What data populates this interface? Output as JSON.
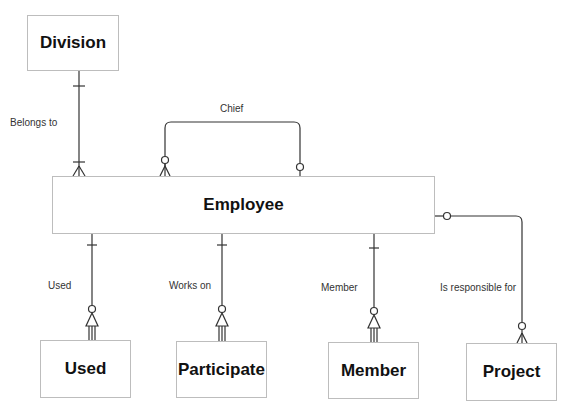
{
  "diagram": {
    "type": "entity-relationship",
    "entities": [
      {
        "id": "division",
        "label": "Division"
      },
      {
        "id": "employee",
        "label": "Employee"
      },
      {
        "id": "used",
        "label": "Used"
      },
      {
        "id": "participate",
        "label": "Participate"
      },
      {
        "id": "member",
        "label": "Member"
      },
      {
        "id": "project",
        "label": "Project"
      }
    ],
    "relationships": [
      {
        "from": "division",
        "to": "employee",
        "label": "Belongs to",
        "from_card": "one",
        "to_card": "one-or-many"
      },
      {
        "from": "employee",
        "to": "employee",
        "label": "Chief",
        "from_card": "zero-or-many",
        "to_card": "zero-or-one"
      },
      {
        "from": "employee",
        "to": "used",
        "label": "Used",
        "from_card": "one",
        "to_card": "zero-or-many"
      },
      {
        "from": "employee",
        "to": "participate",
        "label": "Works on",
        "from_card": "one",
        "to_card": "zero-or-many"
      },
      {
        "from": "employee",
        "to": "member",
        "label": "Member",
        "from_card": "one",
        "to_card": "zero-or-many"
      },
      {
        "from": "employee",
        "to": "project",
        "label": "Is responsible for",
        "from_card": "zero-or-one",
        "to_card": "zero-or-many"
      }
    ],
    "line_color": "#333333",
    "border_color": "#bdbdbd"
  }
}
